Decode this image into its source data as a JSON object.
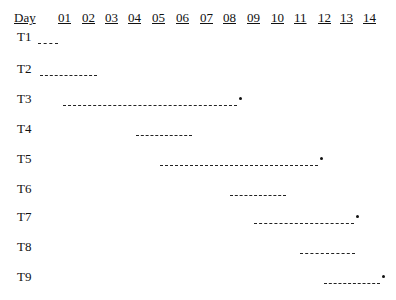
{
  "chart_data": {
    "type": "gantt",
    "title": "",
    "xlabel": "Day",
    "ylabel": "",
    "x_ticks": [
      "01",
      "02",
      "03",
      "04",
      "05",
      "06",
      "07",
      "08",
      "09",
      "10",
      "11",
      "12",
      "13",
      "14"
    ],
    "tasks": [
      {
        "name": "T1",
        "start": 0,
        "end": 1,
        "critical_mark": false
      },
      {
        "name": "T2",
        "start": 0,
        "end": 2,
        "critical_mark": false
      },
      {
        "name": "T3",
        "start": 1,
        "end": 8,
        "critical_mark": true
      },
      {
        "name": "T4",
        "start": 4,
        "end": 6,
        "critical_mark": false
      },
      {
        "name": "T5",
        "start": 5,
        "end": 11.5,
        "critical_mark": true
      },
      {
        "name": "T6",
        "start": 8,
        "end": 10,
        "critical_mark": false
      },
      {
        "name": "T7",
        "start": 9,
        "end": 13,
        "critical_mark": true
      },
      {
        "name": "T8",
        "start": 11,
        "end": 13,
        "critical_mark": false
      },
      {
        "name": "T9",
        "start": 12,
        "end": 14,
        "critical_mark": true
      }
    ],
    "grid": false,
    "legend": null
  },
  "header": {
    "day_label": "Day",
    "ticks": [
      "01",
      "02",
      "03",
      "04",
      "05",
      "06",
      "07",
      "08",
      "09",
      "10",
      "11",
      "12",
      "13",
      "14"
    ]
  },
  "rows": [
    {
      "label": "T1",
      "y": 40,
      "x1": 38,
      "x2": 58,
      "dot": false
    },
    {
      "label": "T2",
      "y": 72,
      "x1": 40,
      "x2": 97,
      "dot": false
    },
    {
      "label": "T3",
      "y": 102,
      "x1": 63,
      "x2": 237,
      "dot": true
    },
    {
      "label": "T4",
      "y": 132,
      "x1": 136,
      "x2": 192,
      "dot": false
    },
    {
      "label": "T5",
      "y": 162,
      "x1": 160,
      "x2": 318,
      "dot": true
    },
    {
      "label": "T6",
      "y": 192,
      "x1": 230,
      "x2": 286,
      "dot": false
    },
    {
      "label": "T7",
      "y": 220,
      "x1": 254,
      "x2": 354,
      "dot": true
    },
    {
      "label": "T8",
      "y": 250,
      "x1": 300,
      "x2": 355,
      "dot": false
    },
    {
      "label": "T9",
      "y": 280,
      "x1": 324,
      "x2": 380,
      "dot": true
    }
  ]
}
